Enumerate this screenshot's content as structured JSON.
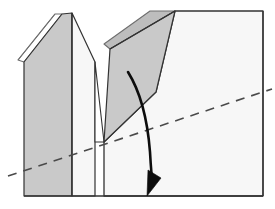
{
  "figure": {
    "canvas": {
      "width": 275,
      "height": 209
    },
    "background_color": "#ffffff"
  },
  "colors": {
    "background": "#ffffff",
    "outline": "#333333",
    "outline_light": "#6f6f6f",
    "face_shaded": "#c9c9c9",
    "face_shaded_dark": "#bdbdbd",
    "face_light": "#f7f7f7",
    "face_white": "#ffffff",
    "dashed_line": "#4a4a4a",
    "arrow": "#0d0d0d"
  },
  "shapes": [
    {
      "name": "left-back-flap",
      "kind": "polygon",
      "fill": "face_white",
      "stroke": "outline_light",
      "points": "18,60 55,14 62,14 24,62"
    },
    {
      "name": "left-front-face",
      "kind": "polygon",
      "fill": "face_shaded",
      "stroke": "outline",
      "points": "24,62 62,14 72,13 72,196 24,196"
    },
    {
      "name": "left-peak-inner-face",
      "kind": "polygon",
      "fill": "face_light",
      "stroke": "outline",
      "points": "72,13 95,62 95,196 72,196"
    },
    {
      "name": "valley-left-face",
      "kind": "polygon",
      "fill": "face_white",
      "stroke": "outline",
      "points": "95,62 104,142 95,142"
    },
    {
      "name": "middle-back-flap",
      "kind": "polygon",
      "fill": "face_shaded_dark",
      "stroke": "outline_light",
      "points": "104,44 150,11 175,11 110,49"
    },
    {
      "name": "middle-front-face",
      "kind": "polygon",
      "fill": "face_shaded",
      "stroke": "outline",
      "points": "110,49 175,11 156,92 104,142"
    },
    {
      "name": "right-panel",
      "kind": "polygon",
      "fill": "face_light",
      "stroke": "outline",
      "points": "175,11 263,11 263,196 104,196 104,142 156,92"
    }
  ],
  "edges": [
    {
      "name": "left-outer-slope",
      "from": [
        18,
        60
      ],
      "to": [
        55,
        14
      ]
    },
    {
      "name": "left-ridge",
      "from": [
        72,
        13
      ],
      "to": [
        72,
        196
      ]
    },
    {
      "name": "left-peak-apex",
      "from": [
        72,
        13
      ],
      "to": [
        95,
        62
      ]
    },
    {
      "name": "valley-bottom",
      "from": [
        95,
        62
      ],
      "to": [
        104,
        142
      ]
    },
    {
      "name": "middle-fold-crease",
      "from": [
        110,
        49
      ],
      "to": [
        175,
        11
      ]
    },
    {
      "name": "middle-left-edge",
      "from": [
        104,
        142
      ],
      "to": [
        110,
        49
      ]
    },
    {
      "name": "right-panel-diagonal",
      "from": [
        175,
        11
      ],
      "to": [
        156,
        92
      ]
    },
    {
      "name": "right-panel-lower-diagonal",
      "from": [
        156,
        92
      ],
      "to": [
        104,
        142
      ]
    },
    {
      "name": "base-edge",
      "from": [
        24,
        196
      ],
      "to": [
        263,
        196
      ]
    },
    {
      "name": "right-edge",
      "from": [
        263,
        11
      ],
      "to": [
        263,
        196
      ]
    },
    {
      "name": "top-edge",
      "from": [
        175,
        11
      ],
      "to": [
        263,
        11
      ]
    }
  ],
  "dashed_line": {
    "name": "reference-fold-line",
    "from": [
      8,
      176
    ],
    "to": [
      272,
      89
    ],
    "dash_pattern": "9 7",
    "width": 1.6,
    "color": "#4a4a4a"
  },
  "arrow": {
    "name": "fold-direction-arrow",
    "path": "M 128,72 C 143,96 148,126 150,152 C 151,170 152,180 153,186",
    "head_points": "147,196 148,170 161,178",
    "width": 2.6,
    "color": "#0d0d0d",
    "meaning": "fold downward"
  },
  "labels": {
    "caption": "",
    "annotations": []
  }
}
